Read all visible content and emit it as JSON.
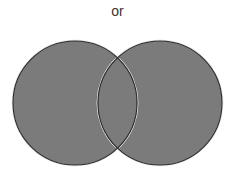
{
  "diagram": {
    "type": "venn",
    "label": "or",
    "operation": "union",
    "fill_color": "#7b7b7b",
    "stroke_color": "#2a2a2a",
    "highlight_color": "#e8e8e8",
    "sets": [
      {
        "name": "left-set",
        "cx": 75,
        "cy": 103,
        "r": 62,
        "shaded": true
      },
      {
        "name": "right-set",
        "cx": 160,
        "cy": 103,
        "r": 62,
        "shaded": true
      }
    ],
    "intersection_shaded": true
  }
}
